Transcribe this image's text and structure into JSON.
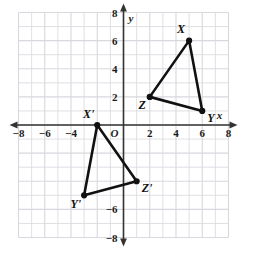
{
  "figure": {
    "title": "",
    "type": "coordinate-plane-geometry",
    "origin_label": "O",
    "x_axis_name": "x",
    "y_axis_name": "y"
  },
  "axes": {
    "x_range": [
      -8,
      8
    ],
    "y_range": [
      -8,
      8
    ],
    "grid_step": 1,
    "tick_step": 2,
    "x_tick_labels": [
      "-8",
      "-6",
      "-4",
      "2",
      "4",
      "6",
      "8"
    ],
    "x_tick_values": [
      -8,
      -6,
      -4,
      2,
      4,
      6,
      8
    ],
    "y_tick_labels": [
      "8",
      "6",
      "4",
      "2",
      "-6",
      "-8"
    ],
    "y_tick_values": [
      8,
      6,
      4,
      2,
      -6,
      -8
    ],
    "grid": true,
    "grid_color": "#d8d8de",
    "axis_color": "#333333"
  },
  "chart_data": {
    "type": "scatter",
    "title": "",
    "xlabel": "x",
    "ylabel": "y",
    "xlim": [
      -8,
      8
    ],
    "ylim": [
      -8,
      8
    ],
    "grid": true,
    "series": [
      {
        "name": "Triangle XYZ",
        "closed": true,
        "points": [
          {
            "label": "X",
            "x": 5,
            "y": 6
          },
          {
            "label": "Y",
            "x": 6,
            "y": 1
          },
          {
            "label": "Z",
            "x": 2,
            "y": 2
          }
        ]
      },
      {
        "name": "Triangle X'Y'Z'",
        "closed": true,
        "points": [
          {
            "label": "X'",
            "x": -2,
            "y": 0
          },
          {
            "label": "Y'",
            "x": -3,
            "y": -5
          },
          {
            "label": "Z'",
            "x": 1,
            "y": -4
          }
        ]
      }
    ]
  },
  "labels": {
    "X": "X",
    "Y": "Y",
    "Z": "Z",
    "Xp": "X'",
    "Yp": "Y'",
    "Zp": "Z'"
  },
  "colors": {
    "shape_stroke": "#111111",
    "vertex_fill": "#111111",
    "grid": "#d8d8de",
    "axis": "#333333",
    "background": "#ffffff"
  }
}
